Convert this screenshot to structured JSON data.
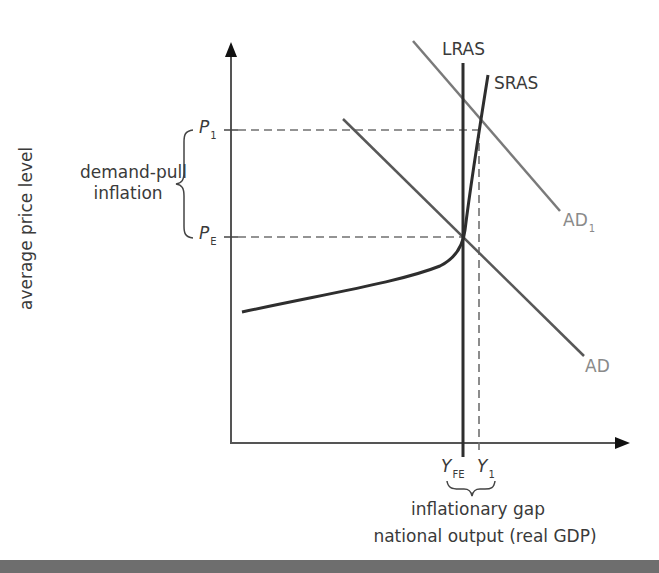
{
  "diagram": {
    "title": "",
    "type": "AD-AS inflationary gap",
    "axes": {
      "y_label": "average price level",
      "x_label": "national output (real GDP)"
    },
    "curves": {
      "lras": {
        "label": "LRAS"
      },
      "sras": {
        "label": "SRAS"
      },
      "ad": {
        "label": "AD"
      },
      "ad1": {
        "label": "AD",
        "subscript": "1"
      }
    },
    "price_levels": {
      "p1": {
        "label": "P",
        "subscript": "1"
      },
      "pe": {
        "label": "P",
        "subscript": "E"
      }
    },
    "output_levels": {
      "yfe": {
        "label": "Y",
        "subscript": "FE"
      },
      "y1": {
        "label": "Y",
        "subscript": "1"
      }
    },
    "annotations": {
      "demand_pull_line1": "demand-pull",
      "demand_pull_line2": "inflation",
      "inflationary_gap": "inflationary gap"
    },
    "colors": {
      "dark_line": "#2e2e2e",
      "gray_line": "#6a6a6a",
      "light_line": "#8a8a8a",
      "dashed": "#707070",
      "bottom_bar": "#6e6e6e"
    }
  }
}
